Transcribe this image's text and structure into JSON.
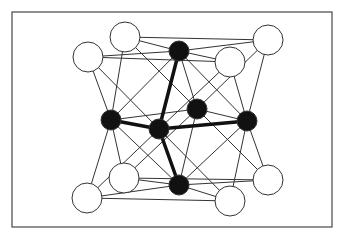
{
  "diagram": {
    "type": "crystal-structure",
    "frame": {
      "x": 12,
      "y": 12,
      "width": 320,
      "height": 215,
      "stroke": "#555555"
    },
    "colors": {
      "line": "#333333",
      "bond": "#111111",
      "open_fill": "#ffffff",
      "solid_fill": "#111111"
    },
    "open_atoms": [
      {
        "id": "A",
        "x": 88,
        "y": 57,
        "r": 15
      },
      {
        "id": "B",
        "x": 125,
        "y": 37,
        "r": 15
      },
      {
        "id": "C",
        "x": 230,
        "y": 62,
        "r": 15
      },
      {
        "id": "D",
        "x": 268,
        "y": 40,
        "r": 15
      },
      {
        "id": "E",
        "x": 87,
        "y": 198,
        "r": 15
      },
      {
        "id": "F",
        "x": 124,
        "y": 178,
        "r": 15
      },
      {
        "id": "G",
        "x": 230,
        "y": 201,
        "r": 15
      },
      {
        "id": "H",
        "x": 268,
        "y": 180,
        "r": 15
      }
    ],
    "solid_atoms": [
      {
        "id": "T",
        "x": 179,
        "y": 51,
        "r": 10
      },
      {
        "id": "L",
        "x": 111,
        "y": 120,
        "r": 10
      },
      {
        "id": "X",
        "x": 159,
        "y": 129,
        "r": 10
      },
      {
        "id": "M",
        "x": 197,
        "y": 109,
        "r": 10
      },
      {
        "id": "R",
        "x": 247,
        "y": 121,
        "r": 10
      },
      {
        "id": "Bt",
        "x": 179,
        "y": 185,
        "r": 10
      }
    ],
    "thin_edges": [
      [
        "A",
        "T"
      ],
      [
        "B",
        "T"
      ],
      [
        "C",
        "T"
      ],
      [
        "D",
        "T"
      ],
      [
        "E",
        "Bt"
      ],
      [
        "F",
        "Bt"
      ],
      [
        "G",
        "Bt"
      ],
      [
        "H",
        "Bt"
      ],
      [
        "A",
        "L"
      ],
      [
        "B",
        "L"
      ],
      [
        "E",
        "L"
      ],
      [
        "F",
        "L"
      ],
      [
        "C",
        "R"
      ],
      [
        "D",
        "R"
      ],
      [
        "G",
        "R"
      ],
      [
        "H",
        "R"
      ],
      [
        "B",
        "M"
      ],
      [
        "D",
        "M"
      ],
      [
        "F",
        "M"
      ],
      [
        "H",
        "M"
      ],
      [
        "A",
        "X"
      ],
      [
        "C",
        "X"
      ],
      [
        "E",
        "X"
      ],
      [
        "G",
        "X"
      ],
      [
        "T",
        "M"
      ],
      [
        "L",
        "M"
      ],
      [
        "R",
        "M"
      ],
      [
        "Bt",
        "M"
      ],
      [
        "T",
        "L"
      ],
      [
        "T",
        "R"
      ],
      [
        "Bt",
        "L"
      ],
      [
        "Bt",
        "R"
      ],
      [
        "B",
        "D"
      ],
      [
        "F",
        "H"
      ],
      [
        "A",
        "C"
      ],
      [
        "E",
        "G"
      ]
    ],
    "thick_edges": [
      [
        "X",
        "T"
      ],
      [
        "X",
        "L"
      ],
      [
        "X",
        "R"
      ],
      [
        "X",
        "Bt"
      ]
    ]
  }
}
